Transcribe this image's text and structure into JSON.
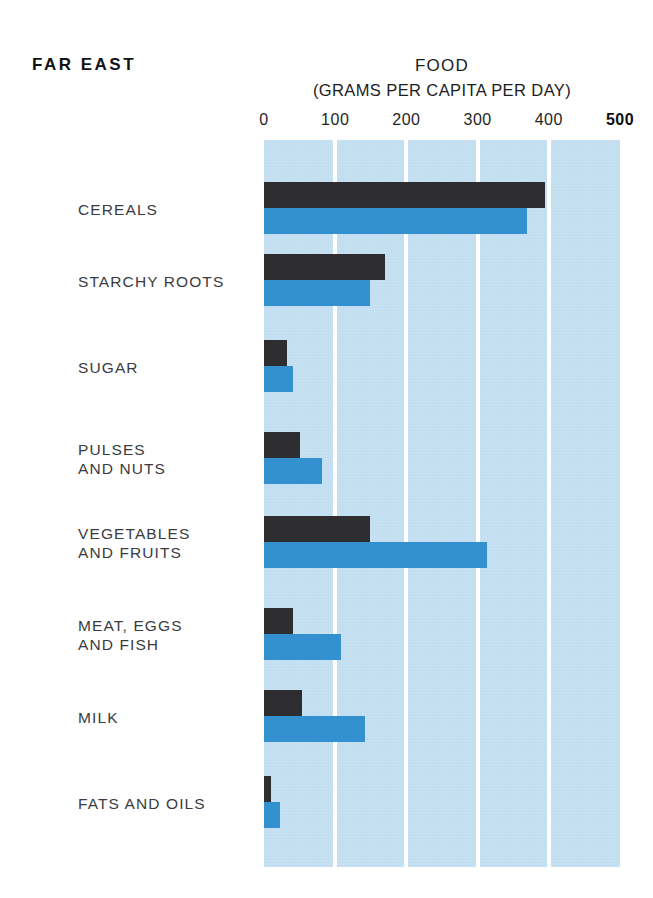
{
  "header": {
    "region": "FAR  EAST",
    "title": "FOOD",
    "subtitle": "(GRAMS PER CAPITA PER DAY)"
  },
  "colors": {
    "plot_background": "#bfddf0",
    "gridline": "#ffffff",
    "series_dark": "#2e2e30",
    "series_blue": "#3291ce",
    "text": "#3a3c3f"
  },
  "chart_data": {
    "type": "bar",
    "orientation": "horizontal",
    "title": "FOOD",
    "subtitle": "(GRAMS PER CAPITA PER DAY)",
    "region": "FAR  EAST",
    "xlabel": "",
    "ylabel": "",
    "xlim": [
      0,
      500
    ],
    "xticks": [
      0,
      100,
      200,
      300,
      400,
      500
    ],
    "xtick_labels": [
      "0",
      "100",
      "200",
      "300",
      "400",
      "500"
    ],
    "grid": true,
    "legend": "none",
    "categories": [
      "CEREALS",
      "STARCHY ROOTS",
      "SUGAR",
      "PULSES\nAND NUTS",
      "VEGETABLES\nAND FRUITS",
      "MEAT, EGGS\nAND FISH",
      "MILK",
      "FATS AND OILS"
    ],
    "series": [
      {
        "name": "dark",
        "color": "#2e2e30",
        "values": [
          395,
          170,
          32,
          50,
          149,
          41,
          53,
          10
        ]
      },
      {
        "name": "blue",
        "color": "#3291ce",
        "values": [
          369,
          149,
          41,
          81,
          313,
          108,
          142,
          22
        ]
      }
    ]
  }
}
